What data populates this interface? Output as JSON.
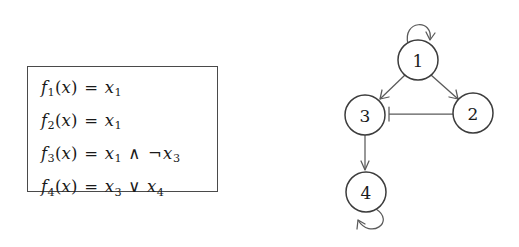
{
  "figure": {
    "background_color": "#ffffff",
    "ink_color": "#3c3c3c"
  },
  "equation_box": {
    "border_color": "#4a4a4a",
    "equations": [
      {
        "id": "f1",
        "text": "f1(x) = x1",
        "lhs_name": "f",
        "lhs_index": "1",
        "arg_open": "(",
        "arg": "x",
        "arg_close": ")",
        "equals": "=",
        "rhs": [
          {
            "kind": "var",
            "name": "x",
            "index": "1"
          }
        ]
      },
      {
        "id": "f2",
        "text": "f2(x) = x1",
        "lhs_name": "f",
        "lhs_index": "2",
        "arg_open": "(",
        "arg": "x",
        "arg_close": ")",
        "equals": "=",
        "rhs": [
          {
            "kind": "var",
            "name": "x",
            "index": "1"
          }
        ]
      },
      {
        "id": "f3",
        "text": "f3(x) = x1 ∧ ¬x3",
        "lhs_name": "f",
        "lhs_index": "3",
        "arg_open": "(",
        "arg": "x",
        "arg_close": ")",
        "equals": "=",
        "rhs": [
          {
            "kind": "var",
            "name": "x",
            "index": "1"
          },
          {
            "kind": "op",
            "symbol": "∧"
          },
          {
            "kind": "op",
            "symbol": "¬"
          },
          {
            "kind": "var",
            "name": "x",
            "index": "3"
          }
        ]
      },
      {
        "id": "f4",
        "text": "f4(x) = x3 ∨ x4",
        "lhs_name": "f",
        "lhs_index": "4",
        "arg_open": "(",
        "arg": "x",
        "arg_close": ")",
        "equals": "=",
        "rhs": [
          {
            "kind": "var",
            "name": "x",
            "index": "3"
          },
          {
            "kind": "op",
            "symbol": "∨"
          },
          {
            "kind": "var",
            "name": "x",
            "index": "4"
          }
        ]
      }
    ]
  },
  "graph": {
    "type": "directed-graph",
    "node_radius": 20,
    "nodes": [
      {
        "id": "1",
        "label": "1",
        "cx": 118,
        "cy": 60
      },
      {
        "id": "2",
        "label": "2",
        "cx": 173,
        "cy": 113
      },
      {
        "id": "3",
        "label": "3",
        "cx": 65,
        "cy": 115
      },
      {
        "id": "4",
        "label": "4",
        "cx": 66,
        "cy": 192
      }
    ],
    "edges": [
      {
        "from": "1",
        "to": "3",
        "style": "straight",
        "arrowhead": "open"
      },
      {
        "from": "1",
        "to": "2",
        "style": "straight",
        "arrowhead": "open"
      },
      {
        "from": "2",
        "to": "3",
        "style": "straight",
        "arrowhead": "bar"
      },
      {
        "from": "3",
        "to": "4",
        "style": "straight",
        "arrowhead": "open"
      },
      {
        "from": "1",
        "to": "1",
        "style": "self-loop",
        "loop_side": "top",
        "arrowhead": "open"
      },
      {
        "from": "4",
        "to": "4",
        "style": "self-loop",
        "loop_side": "bottom",
        "arrowhead": "open"
      }
    ]
  }
}
